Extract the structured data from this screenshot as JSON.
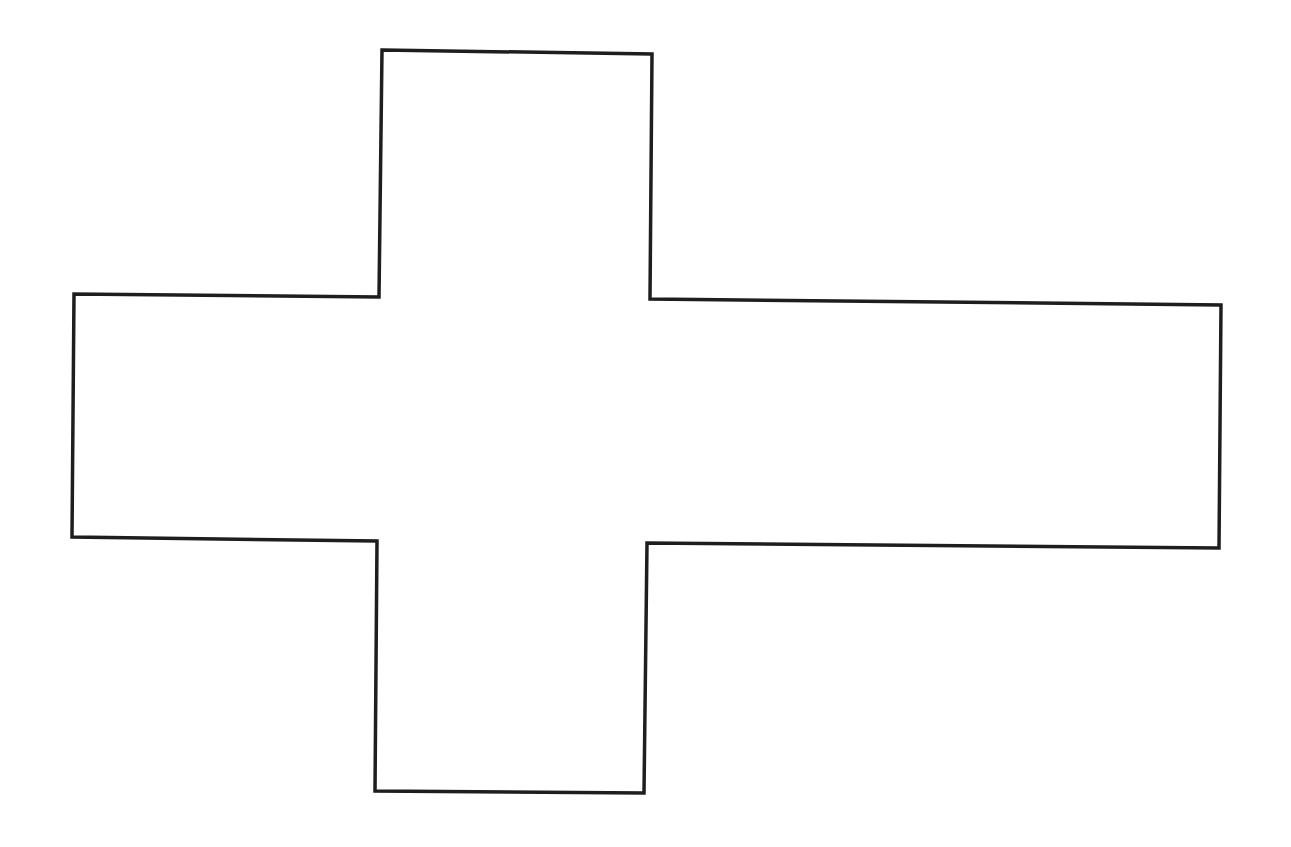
{
  "diagram": {
    "shape": "cross-outline",
    "stroke_color": "#1e1e1e",
    "fill_color": "#ffffff",
    "background_color": "#ffffff",
    "vertices": [
      [
        382,
        50
      ],
      [
        652,
        54
      ],
      [
        650,
        299
      ],
      [
        1221,
        305
      ],
      [
        1219,
        548
      ],
      [
        647,
        543
      ],
      [
        644,
        793
      ],
      [
        375,
        791
      ],
      [
        377,
        541
      ],
      [
        72,
        537
      ],
      [
        74,
        294
      ],
      [
        379,
        297
      ]
    ]
  }
}
